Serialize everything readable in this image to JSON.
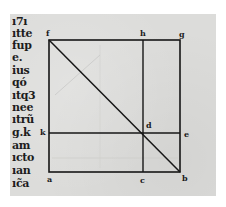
{
  "page": {
    "paper_color": "#dcdcda",
    "ink_color": "#1a1a1a"
  },
  "text_column": {
    "lines": [
      "ı7ı",
      "ıtte",
      "fup",
      "e.",
      "ius",
      "qó",
      "ıtq3",
      "nee",
      "ıtrũ",
      "g.k",
      "am",
      "ıcto",
      "ıan",
      "ıc̃a"
    ]
  },
  "diagram": {
    "labels": {
      "f": "f",
      "h": "h",
      "g": "g",
      "k": "k",
      "d": "d",
      "e": "e",
      "a": "a",
      "c": "c",
      "b": "b"
    }
  }
}
